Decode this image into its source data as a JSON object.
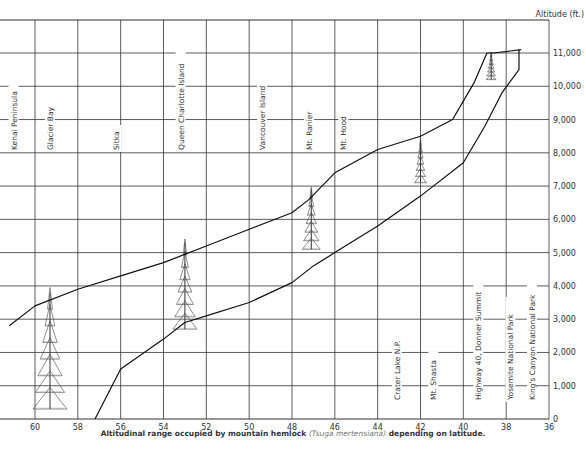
{
  "chart_data": {
    "type": "area",
    "title": "",
    "caption": {
      "prefix": "Altitudinal range occupied by mountain hemlock",
      "scientific_name": "(Tsuga mertensiana)",
      "suffix": "depending on latitude."
    },
    "xlabel": "Latitude",
    "ylabel": "Altitude (ft.)",
    "x_ticks": [
      60,
      58,
      56,
      54,
      52,
      50,
      48,
      46,
      44,
      42,
      40,
      38,
      36
    ],
    "y_ticks": [
      "0",
      "1,000",
      "2,000",
      "3,000",
      "4,000",
      "5,000",
      "6,000",
      "7,000",
      "8,000",
      "9,000",
      "10,000",
      "11,000"
    ],
    "xlim": [
      61.2,
      36
    ],
    "ylim": [
      0,
      12000
    ],
    "grid": true,
    "series": [
      {
        "name": "Upper limit",
        "x": [
          61.2,
          60,
          58,
          56,
          54,
          52,
          50,
          48,
          47.2,
          46,
          44,
          42,
          40.5,
          39.5,
          38.9,
          38.6,
          37.3
        ],
        "y": [
          2800,
          3400,
          3900,
          4300,
          4700,
          5200,
          5700,
          6200,
          6600,
          7400,
          8100,
          8500,
          9000,
          10100,
          11000,
          11000,
          11100
        ]
      },
      {
        "name": "Lower limit",
        "x": [
          57.2,
          56,
          54,
          53,
          52,
          50,
          48,
          47,
          46,
          44,
          42,
          40,
          39,
          38.2,
          37.4,
          37.4
        ],
        "y": [
          0,
          1500,
          2400,
          2900,
          3100,
          3500,
          4100,
          4600,
          5000,
          5800,
          6700,
          7700,
          8800,
          9800,
          10500,
          11100
        ]
      }
    ],
    "place_labels": [
      {
        "name": "Kenai Peninsula",
        "lat": 61.0,
        "position": "upper"
      },
      {
        "name": "Glacier Bay",
        "lat": 59.3,
        "position": "upper"
      },
      {
        "name": "Sitka",
        "lat": 56.2,
        "position": "upper"
      },
      {
        "name": "Queen Charlotte Island",
        "lat": 53.2,
        "position": "upper"
      },
      {
        "name": "Vancouver Island",
        "lat": 49.4,
        "position": "upper"
      },
      {
        "name": "Mt. Ranier",
        "lat": 47.2,
        "position": "upper"
      },
      {
        "name": "Mt. Hood",
        "lat": 45.6,
        "position": "upper"
      },
      {
        "name": "Crater Lake N.P.",
        "lat": 43.1,
        "position": "lower"
      },
      {
        "name": "Mt. Shasta",
        "lat": 41.4,
        "position": "lower"
      },
      {
        "name": "Highway 40, Donner Summit",
        "lat": 39.3,
        "position": "lower"
      },
      {
        "name": "Yosemite National Park",
        "lat": 37.8,
        "position": "lower"
      },
      {
        "name": "King's Canyon National Park",
        "lat": 36.8,
        "position": "lower"
      }
    ],
    "annotations": [
      "tree illustrations at lat 59.3, 53, 47.1, 42, 38.7"
    ]
  }
}
